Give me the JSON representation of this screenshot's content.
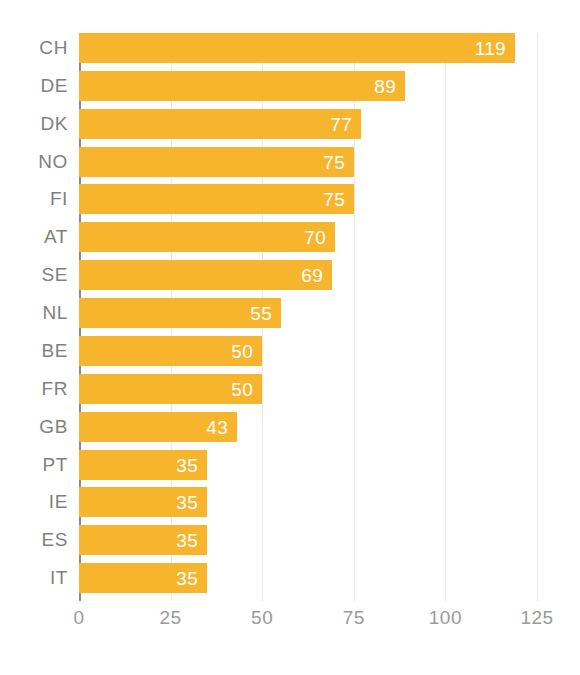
{
  "chart_data": {
    "type": "bar",
    "orientation": "horizontal",
    "title": "",
    "subtitle": "",
    "xlabel": "",
    "ylabel": "",
    "categories": [
      "CH",
      "DE",
      "DK",
      "NO",
      "FI",
      "AT",
      "SE",
      "NL",
      "BE",
      "FR",
      "GB",
      "PT",
      "IE",
      "ES",
      "IT"
    ],
    "values": [
      119,
      89,
      77,
      75,
      75,
      70,
      69,
      55,
      50,
      50,
      43,
      35,
      35,
      35,
      35
    ],
    "data_labels": [
      "119",
      "89",
      "77",
      "75",
      "75",
      "70",
      "69",
      "55",
      "50",
      "50",
      "43",
      "35",
      "35",
      "35",
      "35"
    ],
    "xlim": [
      0,
      125
    ],
    "xticks": [
      0,
      25,
      50,
      75,
      100,
      125
    ],
    "xtick_labels": [
      "0",
      "25",
      "50",
      "75",
      "100",
      "125"
    ],
    "grid": true,
    "grid_axis": "x",
    "legend": false,
    "legend_position": "none",
    "series": [
      {
        "name": "",
        "color": "#F7B52E",
        "values": [
          119,
          89,
          77,
          75,
          75,
          70,
          69,
          55,
          50,
          50,
          43,
          35,
          35,
          35,
          35
        ]
      }
    ]
  },
  "style": {
    "bar_color": "#F7B52E",
    "data_label_color": "#FFFFFF",
    "axis_label_color": "#7F7F7F",
    "tick_label_color": "#9A9A9A",
    "gridline_color": "#E9E9E9",
    "axis_line_color": "#8A8A8A",
    "background": "#FFFFFF"
  }
}
